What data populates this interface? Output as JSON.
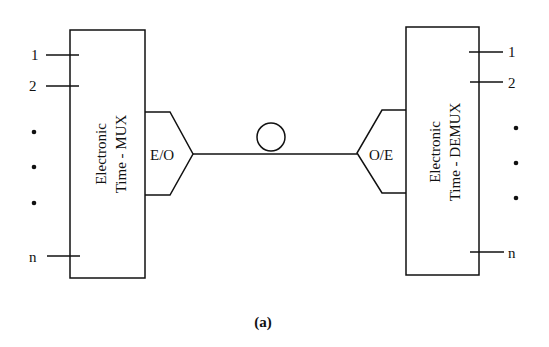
{
  "diagram": {
    "mux": {
      "line1": "Electronic",
      "line2": "Time - MUX",
      "inputs": [
        "1",
        "2",
        "n"
      ]
    },
    "demux": {
      "line1": "Electronic",
      "line2": "Time - DEMUX",
      "outputs": [
        "1",
        "2",
        "n"
      ]
    },
    "eo_label": "E/O",
    "oe_label": "O/E",
    "caption": "(a)"
  }
}
